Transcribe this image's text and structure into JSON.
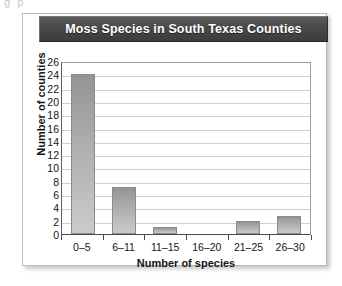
{
  "scan_artifact": {
    "fragment_text": "g  p"
  },
  "chart_data": {
    "type": "bar",
    "title": "Moss Species in South Texas Counties",
    "xlabel": "Number of species",
    "ylabel": "Number of counties",
    "categories": [
      "0–5",
      "6–11",
      "11–15",
      "16–20",
      "21–25",
      "26–30"
    ],
    "values": [
      24,
      7,
      1,
      0,
      2,
      2.7
    ],
    "ylim": [
      0,
      26
    ],
    "ytick_labels": [
      "26",
      "24",
      "22",
      "20",
      "18",
      "16",
      "14",
      "12",
      "10",
      "8",
      "6",
      "4",
      "2",
      "0"
    ],
    "ytick_values": [
      26,
      24,
      22,
      20,
      18,
      16,
      14,
      12,
      10,
      8,
      6,
      4,
      2,
      0
    ],
    "ytick_step": 2,
    "grid": true,
    "legend": null,
    "colors": {
      "bar_top": "#949494",
      "bar_bottom": "#cbcbcb",
      "bar_border": "#8a8a8a",
      "title_banner": "#4a4a4a",
      "title_text": "#ffffff",
      "gridline": "#cfcfcf",
      "axis": "#4a4a4a",
      "plot_background": "#ffffff"
    }
  }
}
